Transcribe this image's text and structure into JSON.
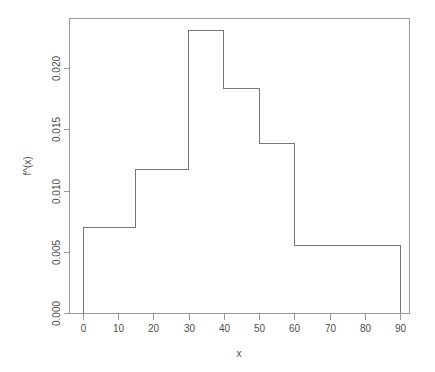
{
  "chart_data": {
    "type": "bar",
    "subtype": "histogram-density",
    "title": "",
    "subtitle": "",
    "xlabel": "x",
    "ylabel": "f^(x)",
    "xlim": [
      0,
      90
    ],
    "ylim": [
      0.0,
      0.0235
    ],
    "grid": false,
    "legend": null,
    "legend_position": "none",
    "breaks": [
      0,
      15,
      30,
      40,
      50,
      60,
      90
    ],
    "bins": [
      {
        "label": "[0,15)",
        "x0": 0,
        "x1": 15,
        "density": 0.007
      },
      {
        "label": "[15,30)",
        "x0": 15,
        "x1": 30,
        "density": 0.0117
      },
      {
        "label": "[30,40)",
        "x0": 30,
        "x1": 40,
        "density": 0.0231
      },
      {
        "label": "[40,50)",
        "x0": 40,
        "x1": 50,
        "density": 0.0183
      },
      {
        "label": "[50,60)",
        "x0": 50,
        "x1": 60,
        "density": 0.0138
      },
      {
        "label": "[60,90]",
        "x0": 60,
        "x1": 90,
        "density": 0.0055
      }
    ],
    "categories": [
      "[0,15)",
      "[15,30)",
      "[30,40)",
      "[40,50)",
      "[50,60)",
      "[60,90]"
    ],
    "values": [
      0.007,
      0.0117,
      0.0231,
      0.0183,
      0.0138,
      0.0055
    ],
    "xticks": [
      0,
      10,
      20,
      30,
      40,
      50,
      60,
      70,
      80,
      90
    ],
    "xtick_labels": [
      "0",
      "10",
      "20",
      "30",
      "40",
      "50",
      "60",
      "70",
      "80",
      "90"
    ],
    "yticks": [
      0.0,
      0.005,
      0.01,
      0.015,
      0.02
    ],
    "ytick_labels": [
      "0.000",
      "0.005",
      "0.010",
      "0.015",
      "0.020"
    ],
    "colors": {
      "background": "#ffffff",
      "line": "#777777",
      "frame": "#999999",
      "text": "#4d4d4d"
    }
  },
  "axes": {
    "x_axis_title": "x",
    "y_axis_title": "f^(x)"
  }
}
